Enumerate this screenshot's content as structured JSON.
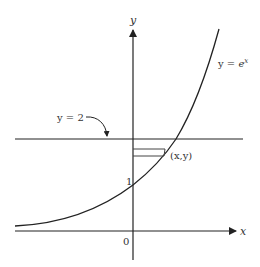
{
  "diagram": {
    "axes": {
      "x_label": "x",
      "y_label": "y",
      "origin_label": "0"
    },
    "curve": {
      "label_prefix": "y = ",
      "label_base": "e",
      "label_exp": "x"
    },
    "horizontal_line": {
      "label": "y = 2"
    },
    "y_intercept_label": "1",
    "point_label": "(x,y)",
    "colors": {
      "stroke": "#222222",
      "text": "#333333",
      "background": "#ffffff"
    }
  }
}
